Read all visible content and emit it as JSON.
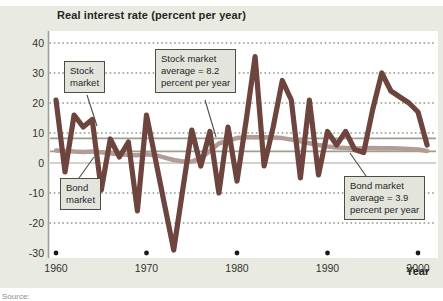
{
  "title": "Real interest rate (percent per year)",
  "x_axis_label": "Year",
  "source_note": "Source:",
  "colors": {
    "card_bg": "#e9ebe3",
    "plot_bg": "#ffffff",
    "stock_line": "#6d453e",
    "bond_line": "#b49c96",
    "average_line": "#9ba08f",
    "grid_dot": "#8f938a",
    "zero_line": "#c1c5bb",
    "axis_line": "#9aa095",
    "tick_text": "#33332c",
    "pointer": "#4d4d45",
    "decade_dot": "#1a1a1a"
  },
  "callouts": {
    "stock_label": "Stock\nmarket",
    "stock_avg": "Stock market\naverage = 8.2\npercent per year",
    "bond_label": "Bond\nmarket",
    "bond_avg": "Bond market\naverage = 3.9\npercent per year"
  },
  "chart_data": {
    "type": "line",
    "title": "Real interest rate (percent per year)",
    "xlabel": "Year",
    "ylabel": "Real interest rate (percent per year)",
    "ylim": [
      -32,
      42
    ],
    "x_range": [
      1959.5,
      2001
    ],
    "grid": "dotted horizontal lines at each 10 units except 0; solid light line at 0",
    "legend_position": "inline callout boxes",
    "y_ticks": [
      40,
      30,
      20,
      10,
      0,
      -10,
      -20,
      -30
    ],
    "y_tick_labels": [
      "40",
      "30",
      "20",
      "10",
      "0",
      "-10",
      "-20",
      "-30"
    ],
    "x_ticks": [
      1960,
      1970,
      1980,
      1990,
      2000
    ],
    "x_tick_labels": [
      "1960",
      "1970",
      "1980",
      "1990",
      "2000"
    ],
    "years": [
      1960,
      1961,
      1962,
      1963,
      1964,
      1965,
      1966,
      1967,
      1968,
      1969,
      1970,
      1971,
      1972,
      1973,
      1974,
      1975,
      1976,
      1977,
      1978,
      1979,
      1980,
      1981,
      1982,
      1983,
      1984,
      1985,
      1986,
      1987,
      1988,
      1989,
      1990,
      1991,
      1992,
      1993,
      1994,
      1995,
      1996,
      1997,
      1998,
      1999,
      2000,
      2001
    ],
    "series": [
      {
        "name": "Stock market",
        "average": 8.2,
        "values": [
          21,
          -3,
          16,
          12,
          14.5,
          -9,
          8,
          2,
          7,
          -16,
          16,
          1,
          -14,
          -29,
          -9,
          11,
          -1,
          10.5,
          -10,
          12,
          -6,
          14,
          35.5,
          -1,
          12,
          27.5,
          21,
          -5,
          21,
          -4,
          10.5,
          6,
          10.5,
          4.5,
          3.5,
          18,
          30,
          24,
          22,
          20,
          17,
          6
        ]
      },
      {
        "name": "Bond market",
        "average": 3.9,
        "values": [
          4.2,
          4.0,
          3.8,
          3.7,
          3.8,
          3.6,
          3.2,
          3.0,
          2.7,
          2.6,
          2.9,
          2.6,
          1.8,
          1.0,
          0.5,
          0.5,
          1.5,
          4.0,
          6.5,
          7.5,
          8.3,
          8.6,
          8.6,
          8.6,
          8.5,
          8.3,
          7.8,
          7.2,
          6.6,
          6.0,
          5.5,
          5.2,
          5.0,
          4.8,
          4.9,
          5.0,
          4.9,
          4.9,
          4.8,
          4.7,
          4.5,
          4.0
        ]
      }
    ]
  }
}
